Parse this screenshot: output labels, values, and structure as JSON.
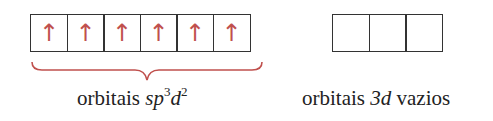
{
  "diagram": {
    "left_group": {
      "boxes": [
        {
          "arrow": "↑"
        },
        {
          "arrow": "↑"
        },
        {
          "arrow": "↑"
        },
        {
          "arrow": "↑"
        },
        {
          "arrow": "↑"
        },
        {
          "arrow": "↑"
        }
      ],
      "label_prefix": "orbitais ",
      "label_s": "sp",
      "label_sup1": "3",
      "label_d": "d",
      "label_sup2": "2"
    },
    "right_group": {
      "boxes": [
        {},
        {},
        {}
      ],
      "label_prefix": "orbitais ",
      "label_italic": "3d",
      "label_suffix": " vazios"
    },
    "colors": {
      "arrow": "#c0504d",
      "brace": "#c0504d",
      "box_border": "#333333"
    }
  }
}
